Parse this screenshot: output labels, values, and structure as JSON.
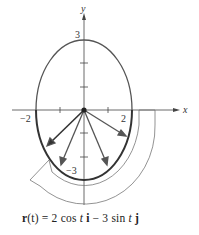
{
  "figure": {
    "axes": {
      "x_label": "x",
      "y_label": "y",
      "tick_labels": {
        "x_neg": "−2",
        "x_pos": "2",
        "y_pos": "3",
        "y_neg": "−3"
      }
    },
    "curve": {
      "type": "ellipse",
      "a": 2,
      "b": 3,
      "direction": "clockwise"
    },
    "caption": {
      "r": "r",
      "t_paren": "(t) = 2 cos ",
      "t1": "t",
      "i": "i",
      "minus": " − 3 sin ",
      "t2": "t",
      "j": "j"
    }
  }
}
